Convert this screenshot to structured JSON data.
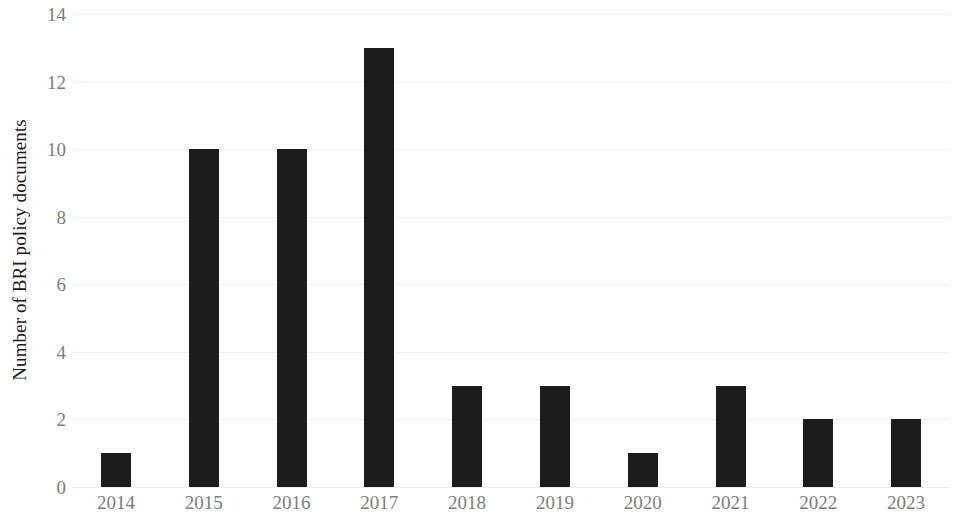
{
  "chart_data": {
    "type": "bar",
    "title": "",
    "subtitle": "",
    "xlabel": "",
    "ylabel": "Number of BRI policy documents",
    "categories": [
      "2014",
      "2015",
      "2016",
      "2017",
      "2018",
      "2019",
      "2020",
      "2021",
      "2022",
      "2023"
    ],
    "values": [
      1,
      10,
      10,
      13,
      3,
      3,
      1,
      3,
      2,
      2
    ],
    "series": [
      {
        "name": "Number of BRI policy documents",
        "values": [
          1,
          10,
          10,
          13,
          3,
          3,
          1,
          3,
          2,
          2
        ]
      }
    ],
    "ylim": [
      0,
      14
    ],
    "y_ticks": [
      0,
      2,
      4,
      6,
      8,
      10,
      12,
      14
    ],
    "y_tick_labels": [
      "0",
      "2",
      "4",
      "6",
      "8",
      "10",
      "12",
      "14"
    ],
    "grid": true,
    "grid_axis": "y",
    "legend": false,
    "legend_position": "none",
    "bar_color": "#1c1c1c",
    "gridline_color": "#f2f2f2",
    "tick_label_color": "#7d7d7d",
    "axis_title_color": "#1a1a1a",
    "background_color": "#ffffff"
  }
}
